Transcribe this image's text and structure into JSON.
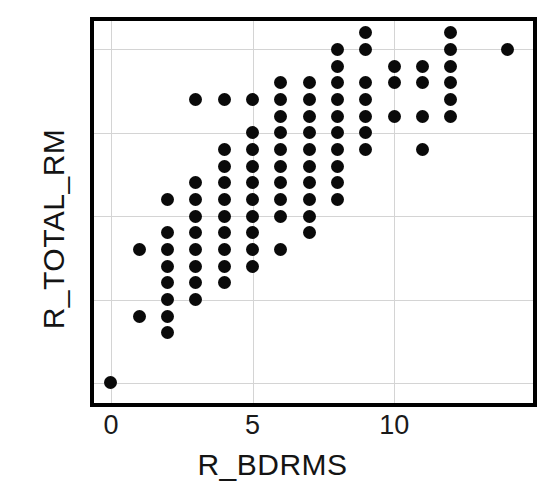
{
  "chart_data": {
    "type": "scatter",
    "title": "",
    "xlabel": "R_BDRMS",
    "ylabel": "R_TOTAL_RM",
    "xlim": [
      -0.6,
      14.9
    ],
    "ylim": [
      -1.2,
      21.7
    ],
    "xticks": [
      0,
      5,
      10
    ],
    "yticks": [
      0,
      5,
      10,
      15,
      20
    ],
    "xtick_labels": [
      "0",
      "5",
      "10"
    ],
    "ytick_labels": [
      "0",
      "5",
      "10",
      "15",
      "20"
    ],
    "grid": true,
    "grid_color": "#d4d4d4",
    "marker_color": "#0a0a0a",
    "marker_shape": "circle",
    "frame_color": "#000000",
    "background": "#ffffff",
    "legend": null,
    "points": [
      {
        "x": 0,
        "y": 0
      },
      {
        "x": 1,
        "y": 4
      },
      {
        "x": 1,
        "y": 8
      },
      {
        "x": 2,
        "y": 3
      },
      {
        "x": 2,
        "y": 4
      },
      {
        "x": 2,
        "y": 5
      },
      {
        "x": 2,
        "y": 6
      },
      {
        "x": 2,
        "y": 7
      },
      {
        "x": 2,
        "y": 8
      },
      {
        "x": 2,
        "y": 9
      },
      {
        "x": 2,
        "y": 11
      },
      {
        "x": 3,
        "y": 5
      },
      {
        "x": 3,
        "y": 6
      },
      {
        "x": 3,
        "y": 7
      },
      {
        "x": 3,
        "y": 8
      },
      {
        "x": 3,
        "y": 9
      },
      {
        "x": 3,
        "y": 10
      },
      {
        "x": 3,
        "y": 11
      },
      {
        "x": 3,
        "y": 12
      },
      {
        "x": 3,
        "y": 17
      },
      {
        "x": 4,
        "y": 6
      },
      {
        "x": 4,
        "y": 7
      },
      {
        "x": 4,
        "y": 8
      },
      {
        "x": 4,
        "y": 9
      },
      {
        "x": 4,
        "y": 10
      },
      {
        "x": 4,
        "y": 11
      },
      {
        "x": 4,
        "y": 12
      },
      {
        "x": 4,
        "y": 13
      },
      {
        "x": 4,
        "y": 14
      },
      {
        "x": 4,
        "y": 17
      },
      {
        "x": 5,
        "y": 7
      },
      {
        "x": 5,
        "y": 8
      },
      {
        "x": 5,
        "y": 9
      },
      {
        "x": 5,
        "y": 10
      },
      {
        "x": 5,
        "y": 11
      },
      {
        "x": 5,
        "y": 12
      },
      {
        "x": 5,
        "y": 13
      },
      {
        "x": 5,
        "y": 14
      },
      {
        "x": 5,
        "y": 15
      },
      {
        "x": 5,
        "y": 17
      },
      {
        "x": 6,
        "y": 8
      },
      {
        "x": 6,
        "y": 10
      },
      {
        "x": 6,
        "y": 11
      },
      {
        "x": 6,
        "y": 12
      },
      {
        "x": 6,
        "y": 13
      },
      {
        "x": 6,
        "y": 14
      },
      {
        "x": 6,
        "y": 15
      },
      {
        "x": 6,
        "y": 16
      },
      {
        "x": 6,
        "y": 17
      },
      {
        "x": 6,
        "y": 18
      },
      {
        "x": 7,
        "y": 9
      },
      {
        "x": 7,
        "y": 10
      },
      {
        "x": 7,
        "y": 11
      },
      {
        "x": 7,
        "y": 12
      },
      {
        "x": 7,
        "y": 13
      },
      {
        "x": 7,
        "y": 14
      },
      {
        "x": 7,
        "y": 15
      },
      {
        "x": 7,
        "y": 16
      },
      {
        "x": 7,
        "y": 17
      },
      {
        "x": 7,
        "y": 18
      },
      {
        "x": 8,
        "y": 11
      },
      {
        "x": 8,
        "y": 12
      },
      {
        "x": 8,
        "y": 13
      },
      {
        "x": 8,
        "y": 14
      },
      {
        "x": 8,
        "y": 15
      },
      {
        "x": 8,
        "y": 16
      },
      {
        "x": 8,
        "y": 17
      },
      {
        "x": 8,
        "y": 18
      },
      {
        "x": 8,
        "y": 19
      },
      {
        "x": 8,
        "y": 20
      },
      {
        "x": 9,
        "y": 14
      },
      {
        "x": 9,
        "y": 15
      },
      {
        "x": 9,
        "y": 16
      },
      {
        "x": 9,
        "y": 17
      },
      {
        "x": 9,
        "y": 18
      },
      {
        "x": 9,
        "y": 20
      },
      {
        "x": 9,
        "y": 21
      },
      {
        "x": 10,
        "y": 16
      },
      {
        "x": 10,
        "y": 18
      },
      {
        "x": 10,
        "y": 19
      },
      {
        "x": 11,
        "y": 14
      },
      {
        "x": 11,
        "y": 16
      },
      {
        "x": 11,
        "y": 18
      },
      {
        "x": 11,
        "y": 19
      },
      {
        "x": 12,
        "y": 16
      },
      {
        "x": 12,
        "y": 17
      },
      {
        "x": 12,
        "y": 18
      },
      {
        "x": 12,
        "y": 19
      },
      {
        "x": 12,
        "y": 20
      },
      {
        "x": 12,
        "y": 21
      },
      {
        "x": 14,
        "y": 20
      }
    ]
  }
}
